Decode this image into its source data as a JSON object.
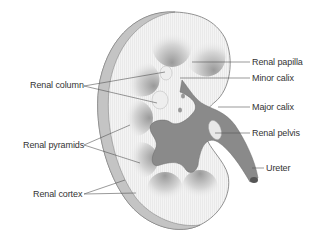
{
  "diagram": {
    "labels_left": [
      {
        "id": "renal-column",
        "text": "Renal column"
      },
      {
        "id": "renal-pyramids",
        "text": "Renal pyramids"
      },
      {
        "id": "renal-cortex",
        "text": "Renal cortex"
      }
    ],
    "labels_right": [
      {
        "id": "renal-papilla",
        "text": "Renal papilla"
      },
      {
        "id": "minor-calix",
        "text": "Minor calix"
      },
      {
        "id": "major-calix",
        "text": "Major calix"
      },
      {
        "id": "renal-pelvis",
        "text": "Renal pelvis"
      },
      {
        "id": "ureter",
        "text": "Ureter"
      }
    ],
    "colors": {
      "background": "#ffffff",
      "outline": "#777777",
      "cortex": "#f2f2f2",
      "capsule": "#bdbdbd",
      "pyramid": "#cfcfcf",
      "pelvis": "#8a8a8a",
      "leader_line": "#555555",
      "text": "#333333"
    }
  }
}
